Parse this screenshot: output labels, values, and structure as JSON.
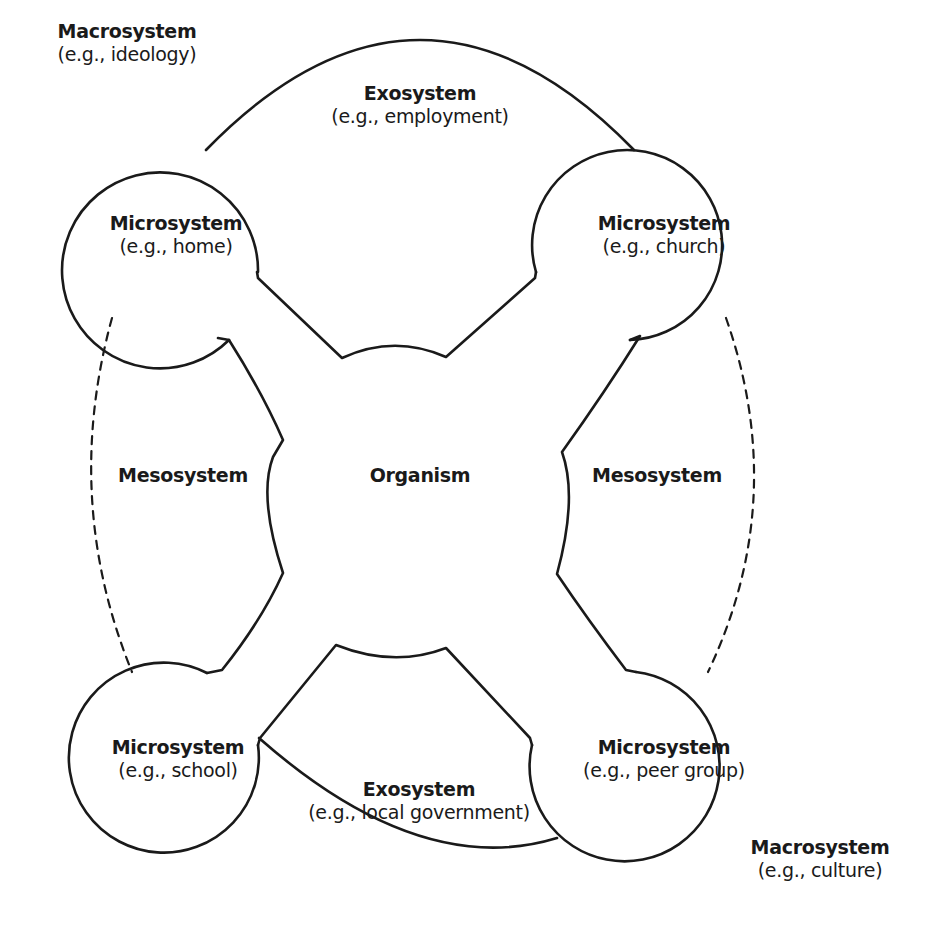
{
  "diagram": {
    "colors": {
      "stroke": "#1a1a1a",
      "background": "#ffffff",
      "text": "#1a1a1a"
    },
    "center": {
      "label": "Organism"
    },
    "mesosystems": [
      {
        "position": "left",
        "label": "Mesosystem"
      },
      {
        "position": "right",
        "label": "Mesosystem"
      }
    ],
    "microsystems": [
      {
        "position": "top-left",
        "label": "Microsystem",
        "example": "(e.g., home)"
      },
      {
        "position": "top-right",
        "label": "Microsystem",
        "example": "(e.g., church)"
      },
      {
        "position": "bottom-left",
        "label": "Microsystem",
        "example": "(e.g., school)"
      },
      {
        "position": "bottom-right",
        "label": "Microsystem",
        "example": "(e.g., peer group)"
      }
    ],
    "exosystems": [
      {
        "position": "top",
        "label": "Exosystem",
        "example": "(e.g., employment)"
      },
      {
        "position": "bottom",
        "label": "Exosystem",
        "example": "(e.g., local government)"
      }
    ],
    "macrosystems": [
      {
        "position": "top-left",
        "label": "Macrosystem",
        "example": "(e.g., ideology)"
      },
      {
        "position": "bottom-right",
        "label": "Macrosystem",
        "example": "(e.g., culture)"
      }
    ]
  }
}
